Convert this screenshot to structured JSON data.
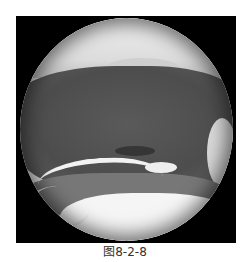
{
  "figure": {
    "caption": "图8-2-8",
    "image_description": "Circular endoscopic view in grayscale with a light upper band, dark textured central band, bright curved reflections, and a bright lower region",
    "colors": {
      "frame": "#000000",
      "dark_tissue": "#4d4d4d",
      "highlight": "#f2f2f2",
      "caption_text": "#333333"
    }
  }
}
